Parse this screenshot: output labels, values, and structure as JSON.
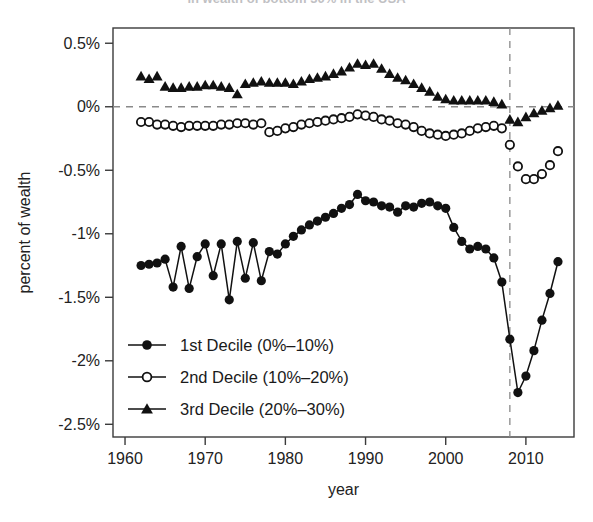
{
  "title": {
    "text": "in wealth of bottom 30% in the USA",
    "cropped": true
  },
  "axes": {
    "x": {
      "label": "year",
      "ticks": [
        "1960",
        "1970",
        "1980",
        "1990",
        "2000",
        "2010"
      ],
      "tick_values": [
        1960,
        1970,
        1980,
        1990,
        2000,
        2010
      ],
      "range": [
        1958.5,
        2016.0
      ]
    },
    "y": {
      "label": "percent of wealth",
      "ticks": [
        "0.5%",
        "0%",
        "-0.5%",
        "-1%",
        "-1.5%",
        "-2%",
        "-2.5%"
      ],
      "tick_values": [
        0.5,
        0,
        -0.5,
        -1,
        -1.5,
        -2,
        -2.5
      ],
      "range": [
        -2.6,
        0.62
      ]
    }
  },
  "annotations": {
    "zero_line": {
      "name": "zero-reference-line",
      "y": 0,
      "style": "dashed"
    },
    "crisis_line": {
      "name": "crisis-reference-line",
      "x": 2008,
      "style": "dashed"
    }
  },
  "legend": {
    "position": "bottom-left-inside",
    "entries": [
      {
        "label": "1st Decile (0%–10%)",
        "marker": "filled-circle",
        "color": "#111111"
      },
      {
        "label": "2nd Decile (10%–20%)",
        "marker": "open-circle",
        "color": "#111111"
      },
      {
        "label": "3rd Decile (20%–30%)",
        "marker": "filled-triangle",
        "color": "#111111"
      }
    ]
  },
  "chart_data": {
    "type": "line",
    "title": "in wealth of bottom 30% in the USA",
    "xlabel": "year",
    "ylabel": "percent of wealth",
    "xlim": [
      1958.5,
      2016.0
    ],
    "ylim": [
      -2.6,
      0.62
    ],
    "grid": false,
    "legend_position": "bottom-left-inside",
    "reference_lines": {
      "horizontal": [
        0
      ],
      "vertical": [
        2008
      ]
    },
    "x": [
      1962,
      1963,
      1964,
      1965,
      1966,
      1967,
      1968,
      1969,
      1970,
      1971,
      1972,
      1973,
      1974,
      1975,
      1976,
      1977,
      1978,
      1979,
      1980,
      1981,
      1982,
      1983,
      1984,
      1985,
      1986,
      1987,
      1988,
      1989,
      1990,
      1991,
      1992,
      1993,
      1994,
      1995,
      1996,
      1997,
      1998,
      1999,
      2000,
      2001,
      2002,
      2003,
      2004,
      2005,
      2006,
      2007,
      2008,
      2009,
      2010,
      2011,
      2012,
      2013,
      2014
    ],
    "series": [
      {
        "name": "1st Decile (0%–10%)",
        "marker": "filled-circle",
        "color": "#111111",
        "values": [
          -1.25,
          -1.24,
          -1.23,
          -1.2,
          -1.42,
          -1.1,
          -1.43,
          -1.18,
          -1.08,
          -1.33,
          -1.08,
          -1.52,
          -1.06,
          -1.35,
          -1.07,
          -1.37,
          -1.14,
          -1.16,
          -1.08,
          -1.02,
          -0.97,
          -0.93,
          -0.9,
          -0.87,
          -0.84,
          -0.8,
          -0.77,
          -0.69,
          -0.74,
          -0.75,
          -0.78,
          -0.79,
          -0.83,
          -0.78,
          -0.79,
          -0.76,
          -0.75,
          -0.78,
          -0.8,
          -0.95,
          -1.06,
          -1.12,
          -1.1,
          -1.12,
          -1.19,
          -1.38,
          -1.83,
          -2.25,
          -2.12,
          -1.92,
          -1.68,
          -1.47,
          -1.22
        ]
      },
      {
        "name": "2nd Decile (10%–20%)",
        "marker": "open-circle",
        "color": "#111111",
        "values": [
          -0.12,
          -0.12,
          -0.14,
          -0.14,
          -0.15,
          -0.16,
          -0.15,
          -0.15,
          -0.15,
          -0.15,
          -0.14,
          -0.14,
          -0.13,
          -0.13,
          -0.14,
          -0.13,
          -0.2,
          -0.19,
          -0.17,
          -0.16,
          -0.14,
          -0.13,
          -0.12,
          -0.11,
          -0.1,
          -0.09,
          -0.08,
          -0.06,
          -0.07,
          -0.08,
          -0.1,
          -0.11,
          -0.13,
          -0.14,
          -0.16,
          -0.19,
          -0.21,
          -0.22,
          -0.23,
          -0.22,
          -0.21,
          -0.19,
          -0.17,
          -0.16,
          -0.15,
          -0.17,
          -0.3,
          -0.47,
          -0.57,
          -0.57,
          -0.53,
          -0.46,
          -0.35
        ]
      },
      {
        "name": "3rd Decile (20%–30%)",
        "marker": "filled-triangle",
        "color": "#111111",
        "values": [
          0.24,
          0.22,
          0.24,
          0.16,
          0.15,
          0.15,
          0.16,
          0.16,
          0.17,
          0.17,
          0.16,
          0.15,
          0.1,
          0.18,
          0.19,
          0.2,
          0.19,
          0.19,
          0.19,
          0.18,
          0.2,
          0.22,
          0.23,
          0.24,
          0.26,
          0.28,
          0.31,
          0.34,
          0.33,
          0.34,
          0.3,
          0.26,
          0.23,
          0.21,
          0.18,
          0.15,
          0.12,
          0.08,
          0.06,
          0.05,
          0.05,
          0.05,
          0.05,
          0.05,
          0.04,
          0.02,
          -0.1,
          -0.12,
          -0.08,
          -0.05,
          -0.03,
          -0.01,
          0.01
        ]
      }
    ]
  }
}
